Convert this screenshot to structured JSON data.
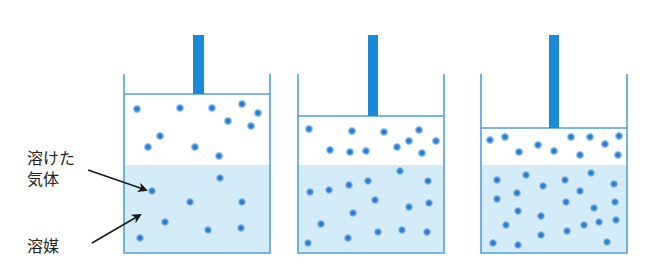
{
  "labels": {
    "dissolved_gas_line1": "溶けた",
    "dissolved_gas_line2": "気体",
    "solvent": "溶媒"
  },
  "colors": {
    "wall": "#4f9ee0",
    "rod": "#1a8ad8",
    "liquid": "#d4ebf8",
    "particle": "#2b7ed0",
    "arrow": "#1a1a1a"
  },
  "containers": [
    {
      "name": "container-low-pressure",
      "left": 124,
      "right": 270,
      "top": 74,
      "bottom": 253,
      "piston_y": 94,
      "liquid_y": 165,
      "rod_x": 193,
      "rod_w": 11,
      "rod_top": 35,
      "gas_particles": [
        [
          137,
          109
        ],
        [
          180,
          108
        ],
        [
          212,
          108
        ],
        [
          242,
          104
        ],
        [
          228,
          121
        ],
        [
          258,
          113
        ],
        [
          251,
          126
        ],
        [
          160,
          136
        ],
        [
          148,
          147
        ],
        [
          195,
          147
        ],
        [
          219,
          156
        ]
      ],
      "liquid_particles": [
        [
          152,
          191
        ],
        [
          190,
          202
        ],
        [
          242,
          202
        ],
        [
          220,
          178
        ],
        [
          165,
          222
        ],
        [
          208,
          230
        ],
        [
          241,
          228
        ],
        [
          140,
          238
        ]
      ]
    },
    {
      "name": "container-medium-pressure",
      "left": 298,
      "right": 444,
      "top": 74,
      "bottom": 253,
      "piston_y": 116,
      "liquid_y": 165,
      "rod_x": 368,
      "rod_w": 10,
      "rod_top": 35,
      "gas_particles": [
        [
          309,
          129
        ],
        [
          352,
          131
        ],
        [
          384,
          132
        ],
        [
          419,
          130
        ],
        [
          330,
          150
        ],
        [
          350,
          152
        ],
        [
          366,
          151
        ],
        [
          397,
          147
        ],
        [
          409,
          141
        ],
        [
          436,
          141
        ],
        [
          422,
          153
        ]
      ],
      "liquid_particles": [
        [
          310,
          192
        ],
        [
          329,
          190
        ],
        [
          349,
          185
        ],
        [
          368,
          181
        ],
        [
          400,
          171
        ],
        [
          428,
          181
        ],
        [
          375,
          200
        ],
        [
          409,
          207
        ],
        [
          429,
          203
        ],
        [
          353,
          213
        ],
        [
          321,
          224
        ],
        [
          348,
          238
        ],
        [
          378,
          232
        ],
        [
          402,
          230
        ],
        [
          427,
          232
        ],
        [
          308,
          243
        ]
      ]
    },
    {
      "name": "container-high-pressure",
      "left": 481,
      "right": 627,
      "top": 74,
      "bottom": 253,
      "piston_y": 128,
      "liquid_y": 165,
      "rod_x": 549,
      "rod_w": 10,
      "rod_top": 35,
      "gas_particles": [
        [
          490,
          140
        ],
        [
          505,
          137
        ],
        [
          519,
          152
        ],
        [
          538,
          145
        ],
        [
          554,
          151
        ],
        [
          571,
          137
        ],
        [
          590,
          137
        ],
        [
          605,
          144
        ],
        [
          619,
          136
        ],
        [
          580,
          155
        ],
        [
          618,
          155
        ]
      ],
      "liquid_particles": [
        [
          497,
          180
        ],
        [
          526,
          175
        ],
        [
          543,
          186
        ],
        [
          565,
          180
        ],
        [
          591,
          173
        ],
        [
          614,
          184
        ],
        [
          517,
          193
        ],
        [
          580,
          191
        ],
        [
          497,
          199
        ],
        [
          566,
          202
        ],
        [
          615,
          202
        ],
        [
          518,
          211
        ],
        [
          541,
          216
        ],
        [
          594,
          208
        ],
        [
          506,
          225
        ],
        [
          541,
          235
        ],
        [
          567,
          231
        ],
        [
          584,
          225
        ],
        [
          599,
          222
        ],
        [
          616,
          220
        ],
        [
          493,
          243
        ],
        [
          518,
          245
        ],
        [
          607,
          242
        ]
      ]
    }
  ],
  "arrows": [
    {
      "name": "arrow-to-dissolved-gas",
      "from": [
        88,
        170
      ],
      "to": [
        146,
        190
      ]
    },
    {
      "name": "arrow-to-solvent",
      "from": [
        92,
        243
      ],
      "to": [
        140,
        215
      ]
    }
  ]
}
